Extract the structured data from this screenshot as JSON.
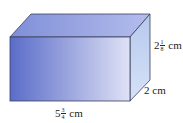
{
  "figure": {
    "type": "rectangular-prism",
    "colors": {
      "front_left": "#5a6cc8",
      "front_right": "#d8dcf4",
      "top": "#8e9ae0",
      "side": "#c4d4f2",
      "edge": "#3a3f5c"
    }
  },
  "labels": {
    "height": {
      "whole": "2",
      "num": "1",
      "den": "8",
      "unit": "cm"
    },
    "depth": {
      "text": "2 cm"
    },
    "length": {
      "whole": "5",
      "num": "3",
      "den": "4",
      "unit": "cm"
    }
  }
}
